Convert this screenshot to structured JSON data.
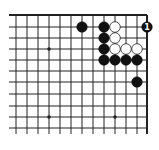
{
  "diagram": {
    "type": "go-board-corner",
    "corner": "top-right",
    "colors": {
      "line": "#222222",
      "black_stone": "#111111",
      "white_stone": "#ffffff",
      "white_stroke": "#222222",
      "background": "#ffffff"
    },
    "grid": {
      "columns_x": [
        16,
        27,
        38,
        49,
        60,
        71,
        82,
        93,
        104,
        115,
        126,
        137,
        147
      ],
      "rows_y": [
        15,
        27,
        38,
        49,
        60,
        71,
        82,
        94,
        106,
        117,
        128
      ],
      "left_extent": 9,
      "bottom_extent": 134,
      "edge_top_y": 15,
      "edge_right_x": 147
    },
    "star_points": [
      {
        "x": 49,
        "y": 49
      },
      {
        "x": 49,
        "y": 117
      },
      {
        "x": 115,
        "y": 117
      }
    ],
    "stones": [
      {
        "color": "black",
        "x": 82,
        "y": 27
      },
      {
        "color": "black",
        "x": 104,
        "y": 27
      },
      {
        "color": "white",
        "x": 115,
        "y": 27
      },
      {
        "color": "black",
        "x": 147,
        "y": 27,
        "label": "1"
      },
      {
        "color": "black",
        "x": 104,
        "y": 38
      },
      {
        "color": "white",
        "x": 115,
        "y": 38
      },
      {
        "color": "black",
        "x": 104,
        "y": 49
      },
      {
        "color": "white",
        "x": 115,
        "y": 49
      },
      {
        "color": "white",
        "x": 126,
        "y": 49
      },
      {
        "color": "white",
        "x": 137,
        "y": 49
      },
      {
        "color": "black",
        "x": 104,
        "y": 60
      },
      {
        "color": "black",
        "x": 115,
        "y": 60
      },
      {
        "color": "black",
        "x": 126,
        "y": 60
      },
      {
        "color": "black",
        "x": 137,
        "y": 60
      },
      {
        "color": "black",
        "x": 137,
        "y": 82
      }
    ],
    "move_label": "1"
  }
}
